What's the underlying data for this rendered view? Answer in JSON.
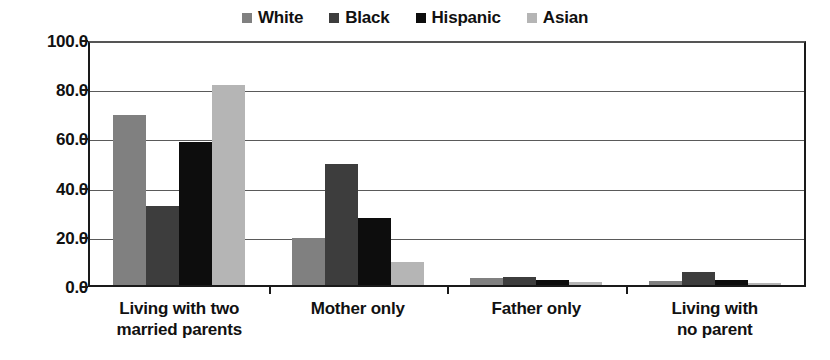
{
  "chart_data": {
    "type": "bar",
    "title": "",
    "subtitle": "",
    "xlabel": "",
    "ylabel": "",
    "ylim": [
      0,
      100
    ],
    "ytick_labels": [
      "0.0",
      "20.0",
      "40.0",
      "60.0",
      "80.0",
      "100.0"
    ],
    "ytick_values": [
      0,
      20,
      40,
      60,
      80,
      100
    ],
    "grid": true,
    "legend_position": "top-center",
    "categories": [
      "Living with two married parents",
      "Mother only",
      "Father only",
      "Living with no parent"
    ],
    "category_lines": [
      [
        "Living with two",
        "married parents"
      ],
      [
        "Mother only"
      ],
      [
        "Father only"
      ],
      [
        "Living with",
        "no parent"
      ]
    ],
    "series": [
      {
        "name": "White",
        "color": "#808080",
        "values": [
          70.0,
          20.0,
          3.5,
          2.5
        ]
      },
      {
        "name": "Black",
        "color": "#3d3d3d",
        "values": [
          33.0,
          50.0,
          4.0,
          6.0
        ]
      },
      {
        "name": "Hispanic",
        "color": "#0d0d0d",
        "values": [
          59.0,
          28.0,
          3.0,
          3.0
        ]
      },
      {
        "name": "Asian",
        "color": "#b5b5b5",
        "values": [
          82.0,
          10.0,
          2.0,
          1.5
        ]
      }
    ]
  }
}
